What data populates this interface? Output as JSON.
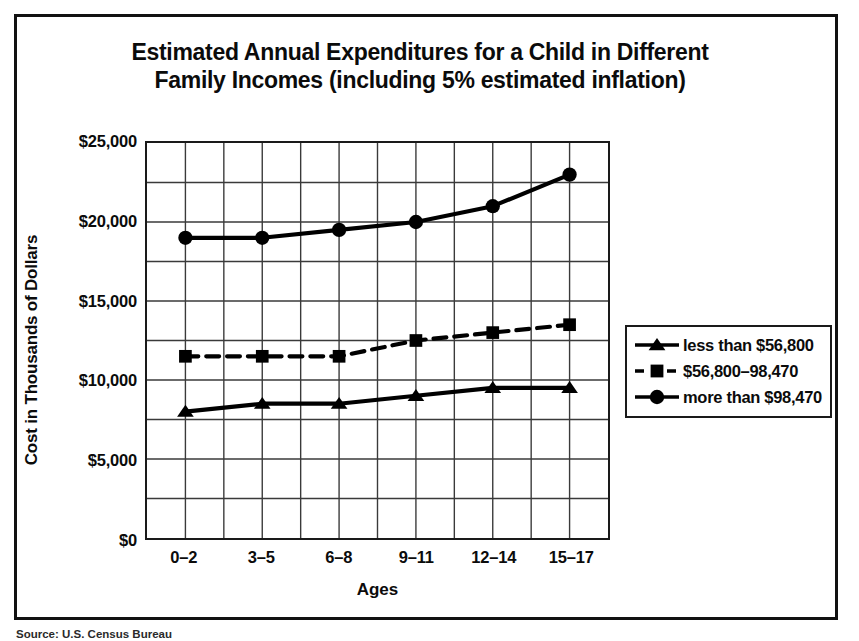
{
  "figure": {
    "title_line1": "Estimated Annual Expenditures for a Child in Different",
    "title_line2": "Family Incomes (including 5% estimated inflation)",
    "source_label": "Source:",
    "source_text": "U.S. Census Bureau"
  },
  "chart_data": {
    "type": "line",
    "title": "Estimated Annual Expenditures for a Child in Different Family Incomes (including 5% estimated inflation)",
    "xlabel": "Ages",
    "ylabel": "Cost in Thousands of Dollars",
    "categories": [
      "0–2",
      "3–5",
      "6–8",
      "9–11",
      "12–14",
      "15–17"
    ],
    "ylim": [
      0,
      25000
    ],
    "ytick_values": [
      0,
      5000,
      10000,
      15000,
      20000,
      25000
    ],
    "ytick_labels": [
      "$0",
      "$5,000",
      "$10,000",
      "$15,000",
      "$20,000",
      "$25,000"
    ],
    "gridline_step": 2500,
    "grid": true,
    "legend_position": "right",
    "series": [
      {
        "name": "less than $56,800",
        "marker": "triangle",
        "linestyle": "solid",
        "color": "#000000",
        "values": [
          8000,
          8500,
          8500,
          9000,
          9500,
          9500
        ]
      },
      {
        "name": "$56,800–98,470",
        "marker": "square",
        "linestyle": "dashed",
        "color": "#000000",
        "values": [
          11500,
          11500,
          11500,
          12500,
          13000,
          13500
        ]
      },
      {
        "name": "more than $98,470",
        "marker": "circle",
        "linestyle": "solid",
        "color": "#000000",
        "values": [
          19000,
          19000,
          19500,
          20000,
          21000,
          23000
        ]
      }
    ]
  }
}
